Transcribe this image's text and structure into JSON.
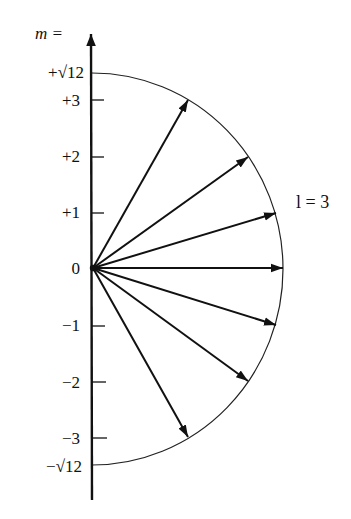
{
  "diagram": {
    "axis_label": "m =",
    "orbit_label": "l = 3",
    "top_label": "+√12",
    "bottom_label": "−√12",
    "tick_labels": [
      "+3",
      "+2",
      "+1",
      "0",
      "−1",
      "−2",
      "−3"
    ],
    "m_values": [
      3,
      2,
      1,
      0,
      -1,
      -2,
      -3
    ],
    "l": 3,
    "radius": "√12",
    "colors": {
      "ink": "#111111",
      "background": "#ffffff"
    }
  }
}
